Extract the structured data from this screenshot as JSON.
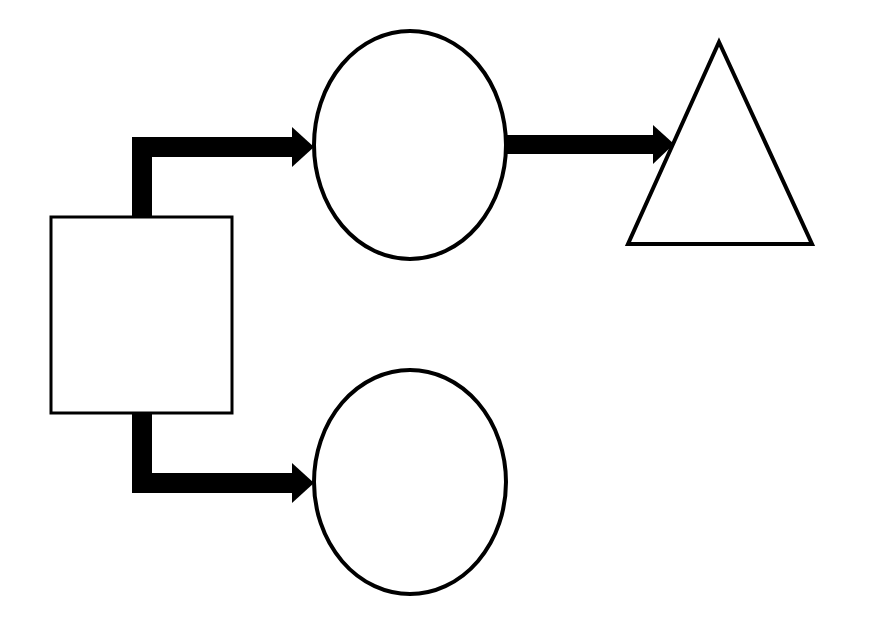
{
  "diagram": {
    "background": "#ffffff",
    "stroke_color": "#000000",
    "fill_color": "#ffffff",
    "shapes": [
      {
        "id": "source-rect",
        "type": "rectangle",
        "label": ""
      },
      {
        "id": "top-ellipse",
        "type": "ellipse",
        "label": ""
      },
      {
        "id": "bottom-ellipse",
        "type": "ellipse",
        "label": ""
      },
      {
        "id": "triangle",
        "type": "triangle",
        "label": ""
      }
    ],
    "connectors": [
      {
        "from": "source-rect",
        "to": "top-ellipse",
        "style": "thick-elbow-arrow"
      },
      {
        "from": "source-rect",
        "to": "bottom-ellipse",
        "style": "thick-elbow-arrow"
      },
      {
        "from": "top-ellipse",
        "to": "triangle",
        "style": "thick-straight-arrow"
      }
    ]
  }
}
